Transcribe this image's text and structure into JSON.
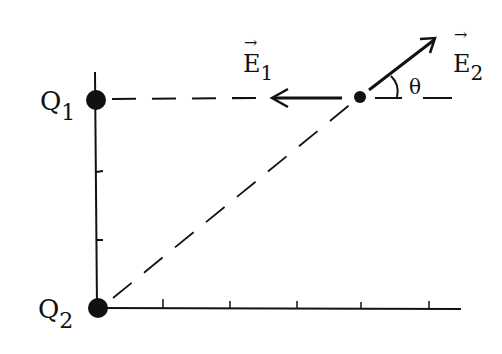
{
  "diagram": {
    "charges": [
      {
        "name": "Q",
        "sub": "1",
        "x": 97,
        "y": 100
      },
      {
        "name": "Q",
        "sub": "2",
        "x": 98,
        "y": 308
      }
    ],
    "point": {
      "x": 360,
      "y": 97
    },
    "vectors": [
      {
        "name": "E",
        "sub": "1",
        "direction": "left",
        "arrow": "→"
      },
      {
        "name": "E",
        "sub": "2",
        "direction": "up-right",
        "arrow": "→"
      }
    ],
    "angle_label": "θ",
    "axes": {
      "x_ticks": 5,
      "y_ticks": 2
    },
    "line_color": "#111111"
  }
}
